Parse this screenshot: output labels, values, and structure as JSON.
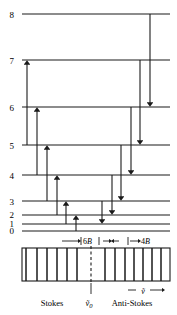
{
  "figure": {
    "levels": [
      {
        "label": "8",
        "y": 14
      },
      {
        "label": "7",
        "y": 60
      },
      {
        "label": "6",
        "y": 107
      },
      {
        "label": "5",
        "y": 145
      },
      {
        "label": "4",
        "y": 175
      },
      {
        "label": "3",
        "y": 201
      },
      {
        "label": "2",
        "y": 215
      },
      {
        "label": "1",
        "y": 224
      },
      {
        "label": "0",
        "y": 231
      }
    ],
    "level_line_x0": 22,
    "level_line_x1": 170,
    "stokes_arrows": [
      {
        "from": "5",
        "to": "7",
        "x": 27
      },
      {
        "from": "4",
        "to": "6",
        "x": 37
      },
      {
        "from": "3",
        "to": "5",
        "x": 47
      },
      {
        "from": "2",
        "to": "4",
        "x": 57
      },
      {
        "from": "1",
        "to": "3",
        "x": 66
      },
      {
        "from": "0",
        "to": "2",
        "x": 76
      }
    ],
    "antistokes_arrows": [
      {
        "from": "8",
        "to": "6",
        "x": 150
      },
      {
        "from": "7",
        "to": "5",
        "x": 140
      },
      {
        "from": "6",
        "to": "4",
        "x": 131
      },
      {
        "from": "5",
        "to": "3",
        "x": 121
      },
      {
        "from": "4",
        "to": "2",
        "x": 112
      },
      {
        "from": "3",
        "to": "1",
        "x": 102
      }
    ],
    "spacing_markers": [
      {
        "label": "6B",
        "symbol": "B"
      },
      {
        "label": "4B",
        "symbol": "B"
      }
    ],
    "spectrum": {
      "box_x0": 22,
      "box_x1": 170,
      "box_y0": 248,
      "box_y1": 281,
      "center_x": 91,
      "stokes_lines_x": [
        26,
        37,
        47,
        57,
        67,
        77
      ],
      "antistokes_lines_x": [
        105,
        115,
        125,
        134,
        143,
        152,
        161
      ],
      "center_label": "ṽ0"
    },
    "axis_label": "ṽ",
    "labels": {
      "stokes": "Stokes",
      "anti_stokes": "Anti-Stokes",
      "nu_zero": "ṽ",
      "nu_zero_sub": "0",
      "nu_tilde": "ṽ",
      "marker_6B_num": "6",
      "marker_6B_sym": "B",
      "marker_4B_num": "4",
      "marker_4B_sym": "B"
    },
    "colors": {
      "line": "#1a1a1a",
      "arrow": "#2b2b2b",
      "background": "#ffffff"
    }
  }
}
